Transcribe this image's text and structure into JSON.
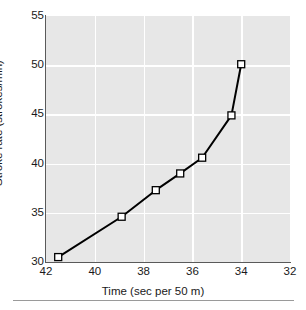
{
  "chart_data": {
    "type": "line",
    "title": "",
    "xlabel": "Time (sec per 50 m)",
    "ylabel": "Stroke rate (strokes/min)",
    "xlim": [
      42,
      32
    ],
    "ylim": [
      30,
      55
    ],
    "x_reversed": true,
    "grid": true,
    "legend": null,
    "marker": "open-square",
    "line_color": "#000000",
    "marker_face_color": "#ffffff",
    "marker_edge_color": "#000000",
    "plot_background": "#e7e7e7",
    "gridline_color": "#ffffff",
    "xticks": [
      42,
      40,
      38,
      36,
      34,
      32
    ],
    "yticks": [
      30,
      35,
      40,
      45,
      50,
      55
    ],
    "xtick_labels": [
      "42",
      "40",
      "38",
      "36",
      "34",
      "32"
    ],
    "ytick_labels": [
      "30",
      "35",
      "40",
      "45",
      "50",
      "55"
    ],
    "x": [
      41.5,
      38.9,
      37.5,
      36.5,
      35.6,
      34.4,
      34.0
    ],
    "y": [
      30.5,
      34.6,
      37.3,
      39.0,
      40.6,
      44.9,
      50.1
    ],
    "points": [
      {
        "x": 41.5,
        "y": 30.5
      },
      {
        "x": 38.9,
        "y": 34.6
      },
      {
        "x": 37.5,
        "y": 37.3
      },
      {
        "x": 36.5,
        "y": 39.0
      },
      {
        "x": 35.6,
        "y": 40.6
      },
      {
        "x": 34.4,
        "y": 44.9
      },
      {
        "x": 34.0,
        "y": 50.1
      }
    ]
  },
  "caption": {
    "text": ""
  }
}
